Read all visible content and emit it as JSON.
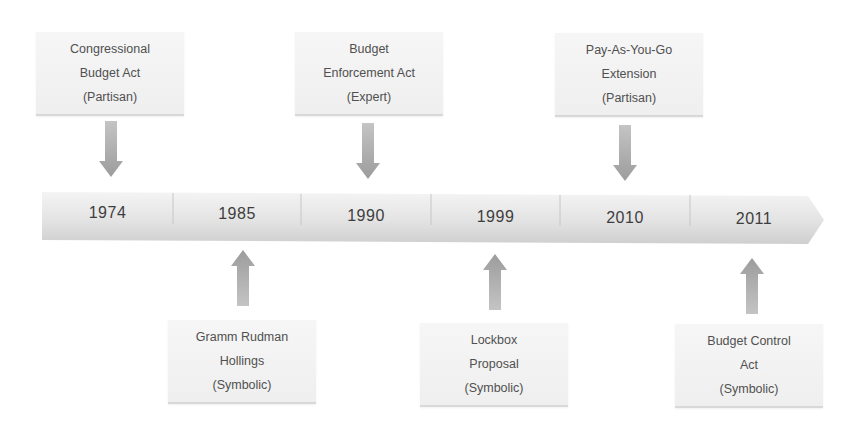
{
  "diagram": {
    "type": "timeline",
    "colors": {
      "box_fill": "#f3f3f3",
      "bar_fill": "#e6e6e6",
      "arrow_fill": "#a9a9a9",
      "text": "#4a4a4a"
    },
    "timeline": {
      "years": [
        "1974",
        "1985",
        "1990",
        "1999",
        "2010",
        "2011"
      ]
    },
    "events_above": [
      {
        "year": "1974",
        "lines": [
          "Congressional",
          "Budget Act",
          "(Partisan)"
        ],
        "arrow": "down-arrow-icon"
      },
      {
        "year": "1990",
        "lines": [
          "Budget",
          "Enforcement Act",
          "(Expert)"
        ],
        "arrow": "down-arrow-icon"
      },
      {
        "year": "2010",
        "lines": [
          "Pay-As-You-Go",
          "Extension",
          "(Partisan)"
        ],
        "arrow": "down-arrow-icon"
      }
    ],
    "events_below": [
      {
        "year": "1985",
        "lines": [
          "Gramm Rudman",
          "Hollings",
          "(Symbolic)"
        ],
        "arrow": "up-arrow-icon"
      },
      {
        "year": "1999",
        "lines": [
          "Lockbox",
          "Proposal",
          "(Symbolic)"
        ],
        "arrow": "up-arrow-icon"
      },
      {
        "year": "2011",
        "lines": [
          "Budget Control",
          "Act",
          "(Symbolic)"
        ],
        "arrow": "up-arrow-icon"
      }
    ]
  }
}
